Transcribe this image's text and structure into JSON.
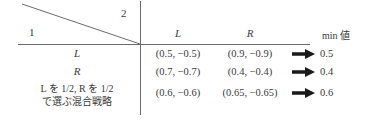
{
  "matrix": {
    "corner": {
      "row_player": "1",
      "col_player": "2",
      "divider": "diagonal"
    },
    "column_headers": [
      "L",
      "R"
    ],
    "min_column_header": "min 値",
    "row_headers": [
      {
        "label": "L",
        "style": "italic"
      },
      {
        "label": "R",
        "style": "italic"
      },
      {
        "label_line1_prefix": "L",
        "label_line1": " を 1/2,  R を 1/2",
        "label_line1_full": "L を 1/2,  R を 1/2",
        "label_line2": "で選ぶ混合戦略",
        "style": "mixed-strategy"
      }
    ],
    "cells": [
      [
        "(0.5, −0.5)",
        "(0.9, −0.9)"
      ],
      [
        "(0.7, −0.7)",
        "(0.4, −0.4)"
      ],
      [
        "(0.6, −0.6)",
        "(0.65, −0.65)"
      ]
    ],
    "min_values": [
      "0.5",
      "0.4",
      "0.6"
    ],
    "arrow_glyph": "➡",
    "arrow_icon_name": "right-arrow-icon"
  },
  "colors": {
    "rule": "#6b6b6b",
    "text": "#3a3a3a",
    "arrow": "#1a1a1a",
    "background": "#ffffff"
  }
}
